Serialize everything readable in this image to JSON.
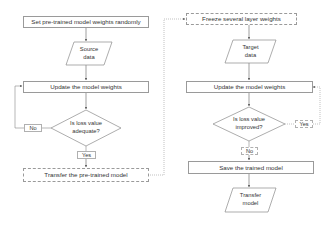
{
  "left_flow": {
    "step1": "Set pre-trained model weights randomly",
    "source_data": [
      "Source",
      "data"
    ],
    "update": "Update the model weights",
    "decision": [
      "Is loss value",
      "adequate?"
    ],
    "no_label": "No",
    "yes_label": "Yes",
    "transfer": "Transfer the pre-trained model"
  },
  "right_flow": {
    "freeze": "Freeze several layer weights",
    "target_data": [
      "Target",
      "data"
    ],
    "update": "Update the model weights",
    "decision": [
      "Is loss value",
      "improved?"
    ],
    "yes_label": "Yes",
    "no_label": "No",
    "save": "Save the trained model",
    "transfer_model": [
      "Transfer",
      "model"
    ]
  },
  "colors": {
    "line": "#888888",
    "border": "#9a9a9a",
    "text": "#333333"
  }
}
